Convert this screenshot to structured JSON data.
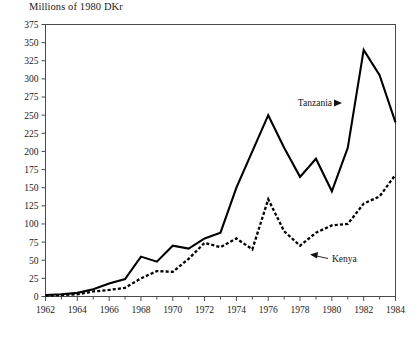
{
  "chart_data": {
    "type": "line",
    "title": "",
    "ylabel": "Millions of 1980 DKr",
    "xlabel": "",
    "ylim": [
      0,
      375
    ],
    "xlim": [
      1962,
      1984
    ],
    "yticks": [
      0,
      25,
      50,
      75,
      100,
      125,
      150,
      175,
      200,
      225,
      250,
      275,
      300,
      325,
      350,
      375
    ],
    "xticks": [
      1962,
      1964,
      1966,
      1968,
      1970,
      1972,
      1974,
      1976,
      1978,
      1980,
      1982,
      1984
    ],
    "xticks_minor": [
      1963,
      1965,
      1967,
      1969,
      1971,
      1973,
      1975,
      1977,
      1979,
      1981,
      1983
    ],
    "grid": false,
    "legend_position": "inline-annotations",
    "x": [
      1962,
      1963,
      1964,
      1965,
      1966,
      1967,
      1968,
      1969,
      1970,
      1971,
      1972,
      1973,
      1974,
      1975,
      1976,
      1977,
      1978,
      1979,
      1980,
      1981,
      1982,
      1983,
      1984
    ],
    "series": [
      {
        "name": "Tanzania",
        "style": "solid",
        "color": "#000000",
        "values": [
          2,
          3,
          5,
          10,
          18,
          24,
          55,
          48,
          70,
          66,
          80,
          88,
          150,
          200,
          250,
          205,
          165,
          190,
          145,
          205,
          340,
          305,
          240
        ]
      },
      {
        "name": "Kenya",
        "style": "dashed",
        "color": "#000000",
        "values": [
          1,
          2,
          3,
          7,
          9,
          12,
          25,
          35,
          34,
          52,
          74,
          68,
          80,
          65,
          134,
          90,
          70,
          88,
          98,
          100,
          128,
          138,
          168
        ]
      }
    ],
    "annotations": [
      {
        "text": "Tanzania",
        "series": "Tanzania",
        "arrow": "right"
      },
      {
        "text": "Kenya",
        "series": "Kenya",
        "arrow": "left"
      }
    ]
  }
}
